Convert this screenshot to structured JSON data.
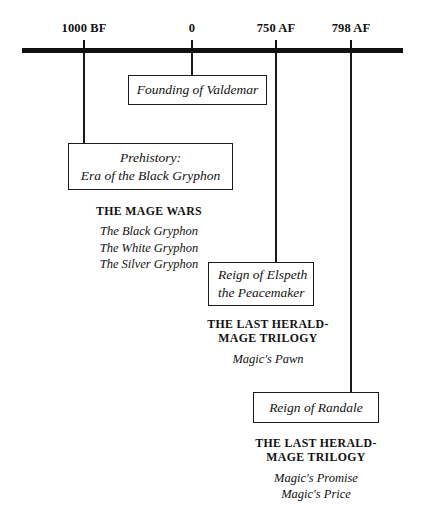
{
  "figure": {
    "kind": "timeline",
    "axis": {
      "name": "valdemar-chronology-axis",
      "ticks": [
        {
          "label": "1000 BF",
          "x": 83
        },
        {
          "label": "0",
          "x": 191
        },
        {
          "label": "750 AF",
          "x": 275
        },
        {
          "label": "798 AF",
          "x": 350
        }
      ]
    },
    "events": [
      {
        "id": "founding",
        "name": "founding-of-valdemar",
        "lines": [
          "Founding of Valdemar"
        ],
        "align": "center"
      },
      {
        "id": "prehistory",
        "name": "prehistory-era-of-the-black-gryphon",
        "lines": [
          "Prehistory:",
          "Era of the Black Gryphon"
        ],
        "align": "center"
      },
      {
        "id": "elspeth",
        "name": "reign-of-elspeth-the-peacemaker",
        "lines": [
          "Reign of Elspeth",
          "the Peacemaker"
        ],
        "align": "left"
      },
      {
        "id": "randale",
        "name": "reign-of-randale",
        "lines": [
          "Reign of Randale"
        ],
        "align": "center"
      }
    ],
    "booklists": [
      {
        "id": "mage-wars",
        "series": [
          "THE MAGE WARS"
        ],
        "titles": [
          "The Black Gryphon",
          "The White Gryphon",
          "The Silver Gryphon"
        ]
      },
      {
        "id": "herald-mage-1",
        "series": [
          "THE LAST HERALD-",
          "MAGE TRILOGY"
        ],
        "titles": [
          "Magic's Pawn"
        ]
      },
      {
        "id": "herald-mage-2",
        "series": [
          "THE LAST HERALD-",
          "MAGE TRILOGY"
        ],
        "titles": [
          "Magic's Promise",
          "Magic's Price"
        ]
      }
    ],
    "colors": {
      "ink": "#111111",
      "background": "#ffffff"
    }
  }
}
